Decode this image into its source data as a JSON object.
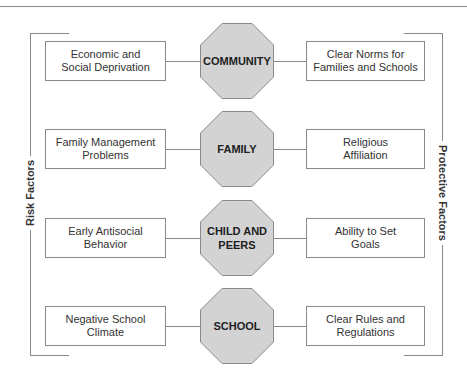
{
  "diagram": {
    "side_labels": {
      "left": "Risk Factors",
      "right": "Protective Factors"
    },
    "colors": {
      "octagon_fill": "#d3d3d3",
      "octagon_stroke": "#8a8a8a",
      "line": "#8a8a8a",
      "text": "#333333"
    },
    "rows": [
      {
        "domain": "COMMUNITY",
        "risk": "Economic and\nSocial Deprivation",
        "protective": "Clear Norms for\nFamilies and Schools"
      },
      {
        "domain": "FAMILY",
        "risk": "Family Management\nProblems",
        "protective": "Religious\nAffiliation"
      },
      {
        "domain": "CHILD AND\nPEERS",
        "risk": "Early Antisocial\nBehavior",
        "protective": "Ability to Set\nGoals"
      },
      {
        "domain": "SCHOOL",
        "risk": "Negative School\nClimate",
        "protective": "Clear Rules and\nRegulations"
      }
    ]
  }
}
